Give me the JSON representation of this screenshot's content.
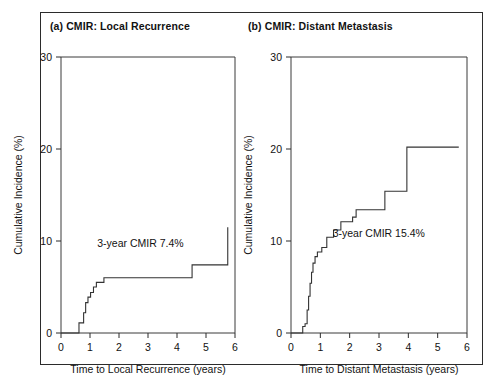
{
  "figure": {
    "background_color": "#ffffff",
    "frame_color": "#2b2b2b",
    "curve_color": "#333333",
    "text_color": "#121212"
  },
  "panels": [
    {
      "key": "local_recurrence",
      "title": "(a) CMIR: Local Recurrence",
      "annotation": "3-year CMIR 7.4%"
    },
    {
      "key": "distant_metastasis",
      "title": "(b) CMIR: Distant Metastasis",
      "annotation": "3-year CMIR 15.4%"
    }
  ],
  "chart_data": [
    {
      "type": "line",
      "subplot": "(a)",
      "title": "(a) CMIR: Local Recurrence",
      "xlabel": "Time to Local Recurrence (years)",
      "ylabel": "Cumulative Incidence (%)",
      "xlim": [
        0,
        6
      ],
      "ylim": [
        0,
        30
      ],
      "xticks": [
        0,
        1,
        2,
        3,
        4,
        5,
        6
      ],
      "yticks": [
        0,
        10,
        20,
        30
      ],
      "xtick_labels": [
        "0",
        "1",
        "2",
        "3",
        "4",
        "5",
        "6"
      ],
      "ytick_labels": [
        "0",
        "10",
        "20",
        "30"
      ],
      "grid": false,
      "legend": false,
      "annotations": [
        {
          "text": "3-year CMIR 7.4%",
          "x": 1.25,
          "y": 9.3
        }
      ],
      "series": [
        {
          "name": "Cumulative incidence of local recurrence",
          "style": "step-post",
          "x": [
            0.0,
            0.38,
            0.62,
            0.72,
            0.78,
            0.85,
            0.93,
            1.02,
            1.12,
            1.22,
            1.48,
            4.52,
            5.75
          ],
          "y": [
            0.0,
            0.0,
            1.1,
            1.1,
            2.2,
            3.3,
            3.9,
            4.4,
            5.0,
            5.5,
            6.0,
            7.4,
            11.5
          ]
        }
      ]
    },
    {
      "type": "line",
      "subplot": "(b)",
      "title": "(b) CMIR: Distant Metastasis",
      "xlabel": "Time to Distant Metastasis (years)",
      "ylabel": "Cumulative Incidence (%)",
      "xlim": [
        0,
        6
      ],
      "ylim": [
        0,
        30
      ],
      "xticks": [
        0,
        1,
        2,
        3,
        4,
        5,
        6
      ],
      "yticks": [
        0,
        10,
        20,
        30
      ],
      "xtick_labels": [
        "0",
        "1",
        "2",
        "3",
        "4",
        "5",
        "6"
      ],
      "ytick_labels": [
        "0",
        "10",
        "20",
        "30"
      ],
      "grid": false,
      "legend": false,
      "annotations": [
        {
          "text": "3-year CMIR 15.4%",
          "x": 1.42,
          "y": 10.4
        }
      ],
      "series": [
        {
          "name": "Cumulative incidence of distant metastasis",
          "style": "step-post",
          "x": [
            0.0,
            0.3,
            0.4,
            0.48,
            0.55,
            0.6,
            0.65,
            0.7,
            0.75,
            0.82,
            0.9,
            1.05,
            1.22,
            1.45,
            1.7,
            2.1,
            2.22,
            3.2,
            3.95,
            5.72
          ],
          "y": [
            0.0,
            0.0,
            0.7,
            1.0,
            2.5,
            4.0,
            5.4,
            6.6,
            7.6,
            8.3,
            8.8,
            9.3,
            10.4,
            11.2,
            12.1,
            12.6,
            13.4,
            15.4,
            20.2,
            20.2
          ]
        }
      ]
    }
  ]
}
